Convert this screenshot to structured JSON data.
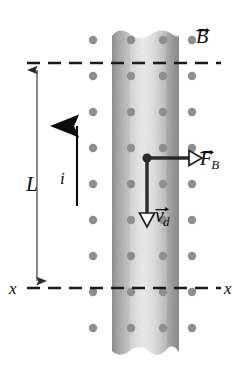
{
  "figure": {
    "type": "physics-diagram",
    "width": 242,
    "height": 372
  },
  "labels": {
    "length": "L",
    "current": "i",
    "axis_left": "x",
    "axis_right": "x",
    "field": "B",
    "force": "F",
    "force_sub": "B",
    "drift_velocity": "v",
    "drift_velocity_sub": "d"
  },
  "elements": {
    "strip_name": "conducting-strip",
    "field_dots_name": "magnetic-field-dots",
    "current_arrow_name": "current-direction-arrow",
    "force_arrow_name": "magnetic-force-arrow",
    "drift_arrow_name": "drift-velocity-arrow",
    "length_dimension_name": "length-dimension-line",
    "top_boundary_name": "top-dashed-line",
    "axis_line_name": "x-x-axis-dashed-line",
    "charge_carrier_name": "charge-carrier-dot"
  },
  "colors": {
    "ink": "#0b0b0b",
    "dot_gray": "#8e8e8e",
    "strip_edge": "#9a9a9a",
    "strip_mid": "#efefef",
    "dash": "#1a1a1a",
    "background": "#ffffff"
  },
  "geometry": {
    "strip_left": 112,
    "strip_right": 179,
    "strip_top": 30,
    "strip_bottom": 360,
    "top_line_y": 63,
    "axis_line_y": 288,
    "dimension_x": 37,
    "current_arrow_x": 77,
    "junction_x": 147,
    "junction_y": 158,
    "dot_columns": [
      93,
      131,
      163,
      192
    ],
    "dot_row_spacing": 36
  },
  "field_dots": {
    "symbol": "dot",
    "meaning": "magnetic-field-out-of-page",
    "count_columns": 4,
    "radius": 4.2
  }
}
